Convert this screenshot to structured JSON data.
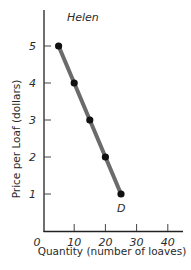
{
  "chart_data": {
    "type": "line",
    "title": "Helen",
    "xlabel": "Quantity (number of loaves)",
    "ylabel": "Price per Loaf (dollars)",
    "x": [
      5,
      10,
      15,
      20,
      25
    ],
    "series": [
      {
        "name": "D",
        "values": [
          5,
          4,
          3,
          2,
          1
        ],
        "color": "#6b6b6b",
        "marker_color": "#111111"
      }
    ],
    "curve_label": "D",
    "xlim": [
      0,
      45
    ],
    "ylim": [
      0,
      6
    ],
    "x_ticks": [
      0,
      10,
      20,
      30,
      40
    ],
    "x_tick_labels": [
      "0",
      "10",
      "20",
      "30",
      "40"
    ],
    "y_ticks": [
      1,
      2,
      3,
      4,
      5
    ],
    "y_tick_labels": [
      "1",
      "2",
      "3",
      "4",
      "5"
    ],
    "grid": false,
    "legend": "none"
  }
}
